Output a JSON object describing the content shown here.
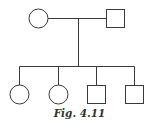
{
  "figure": {
    "caption": "Fig. 4.11",
    "type": "pedigree-chart"
  },
  "colors": {
    "stroke": "#3a3a3a",
    "background": "#ffffff"
  },
  "generations": [
    {
      "level": "parents",
      "members": [
        {
          "sex": "female",
          "shape": "circle",
          "affected": false
        },
        {
          "sex": "male",
          "shape": "square",
          "affected": false
        }
      ]
    },
    {
      "level": "offspring",
      "members": [
        {
          "sex": "female",
          "shape": "circle",
          "affected": false
        },
        {
          "sex": "female",
          "shape": "circle",
          "affected": false
        },
        {
          "sex": "male",
          "shape": "square",
          "affected": false
        },
        {
          "sex": "male",
          "shape": "square",
          "affected": false
        }
      ]
    }
  ]
}
